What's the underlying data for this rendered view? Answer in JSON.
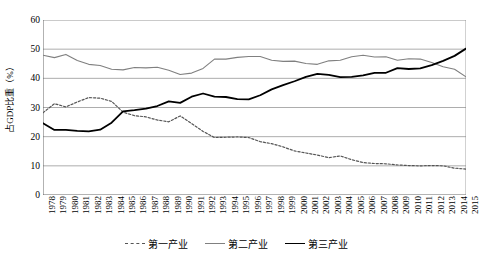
{
  "chart_data": {
    "type": "line",
    "title": "",
    "xlabel": "",
    "ylabel": "占GDP比重（%）",
    "ylim": [
      0,
      60
    ],
    "yticks": [
      0,
      10,
      20,
      30,
      40,
      50,
      60
    ],
    "grid": true,
    "legend_position": "bottom",
    "x": [
      1978,
      1979,
      1980,
      1981,
      1982,
      1983,
      1984,
      1985,
      1986,
      1987,
      1988,
      1989,
      1990,
      1991,
      1992,
      1993,
      1994,
      1995,
      1996,
      1997,
      1998,
      1999,
      2000,
      2001,
      2002,
      2003,
      2004,
      2005,
      2006,
      2007,
      2008,
      2009,
      2010,
      2011,
      2012,
      2013,
      2014,
      2015
    ],
    "series": [
      {
        "name": "第一产业",
        "style": "dotted",
        "color": "#555555",
        "values": [
          28.2,
          31.3,
          30.2,
          31.9,
          33.4,
          33.2,
          32.1,
          28.4,
          27.2,
          26.8,
          25.7,
          25.1,
          27.1,
          24.5,
          21.8,
          19.7,
          19.8,
          19.9,
          19.7,
          18.3,
          17.6,
          16.5,
          15.1,
          14.4,
          13.7,
          12.8,
          13.4,
          12.1,
          11.1,
          10.8,
          10.7,
          10.3,
          10.1,
          10.0,
          10.1,
          10.0,
          9.2,
          8.9
        ]
      },
      {
        "name": "第二产业",
        "style": "solid",
        "color": "#808080",
        "values": [
          47.9,
          47.1,
          48.2,
          46.1,
          44.8,
          44.4,
          43.1,
          42.9,
          43.7,
          43.6,
          43.8,
          42.8,
          41.3,
          41.8,
          43.4,
          46.6,
          46.6,
          47.2,
          47.5,
          47.5,
          46.2,
          45.8,
          45.9,
          45.1,
          44.8,
          46.0,
          46.2,
          47.4,
          47.9,
          47.3,
          47.4,
          46.2,
          46.7,
          46.6,
          45.4,
          44.0,
          43.1,
          40.5
        ]
      },
      {
        "name": "第三产业",
        "style": "solid",
        "color": "#000000",
        "values": [
          24.6,
          22.3,
          22.3,
          22.0,
          21.8,
          22.4,
          24.8,
          28.7,
          29.1,
          29.6,
          30.5,
          32.1,
          31.6,
          33.7,
          34.8,
          33.7,
          33.6,
          32.9,
          32.8,
          34.2,
          36.2,
          37.7,
          39.0,
          40.5,
          41.5,
          41.2,
          40.4,
          40.5,
          41.0,
          41.9,
          41.9,
          43.5,
          43.2,
          43.4,
          44.5,
          46.0,
          47.7,
          50.2
        ]
      }
    ]
  }
}
